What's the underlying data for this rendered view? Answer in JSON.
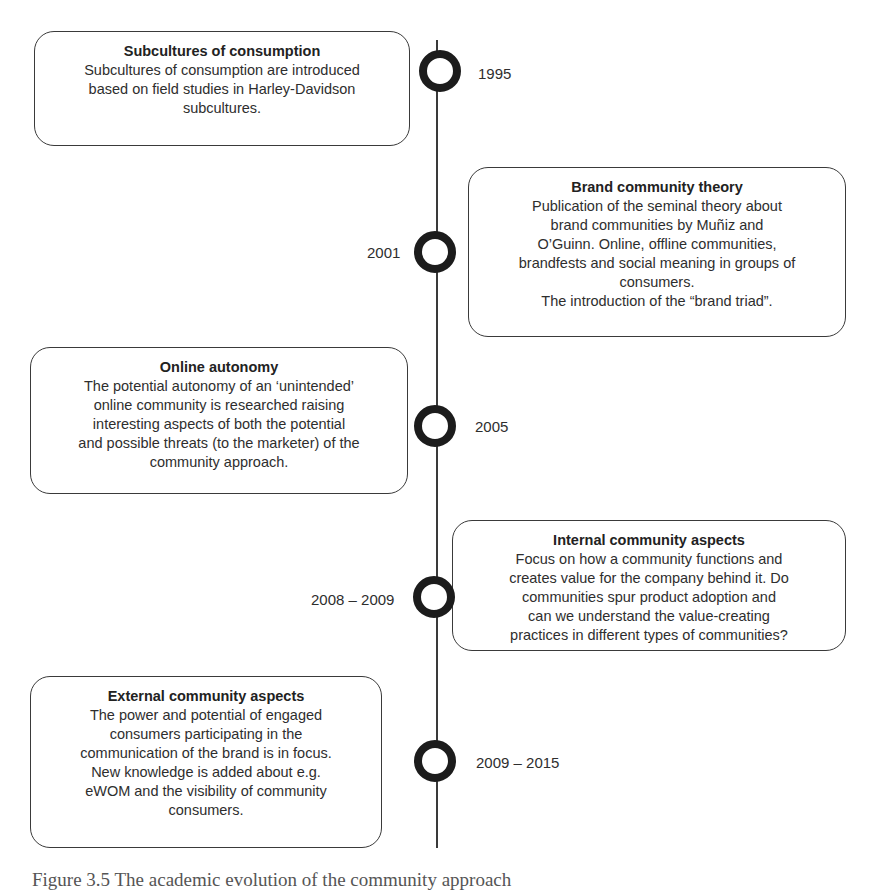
{
  "timeline": {
    "events": [
      {
        "year": "1995",
        "title": "Subcultures of consumption",
        "body": "Subcultures of consumption are introduced\nbased on field studies in Harley-Davidson\nsubcultures.",
        "side": "left"
      },
      {
        "year": "2001",
        "title": "Brand community theory",
        "body": "Publication of the seminal theory about\nbrand communities by Muñiz and\nO’Guinn. Online, offline communities,\nbrandfests and social meaning in groups of\nconsumers.\nThe introduction of the “brand triad”.",
        "side": "right"
      },
      {
        "year": "2005",
        "title": "Online autonomy",
        "body": "The potential autonomy of an ‘unintended’\nonline community is researched raising\ninteresting aspects of both the potential\nand possible threats (to the marketer) of the\ncommunity approach.",
        "side": "left"
      },
      {
        "year": "2008 – 2009",
        "title": "Internal community aspects",
        "body": "Focus on how a community functions and\ncreates value for the company behind it. Do\ncommunities spur product adoption and\ncan we understand the value-creating\npractices in different types of communities?",
        "side": "right"
      },
      {
        "year": "2009 – 2015",
        "title": "External community aspects",
        "body": "The power and potential of engaged\nconsumers participating in the\ncommunication of the brand is in focus.\nNew knowledge is added about e.g.\neWOM and the visibility of community\nconsumers.",
        "side": "left"
      }
    ]
  },
  "caption": "Figure 3.5 The academic evolution of the community approach"
}
